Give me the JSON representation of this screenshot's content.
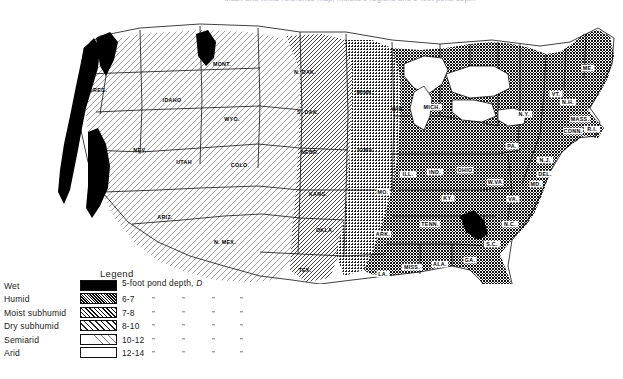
{
  "figure": {
    "caption_clipped": "black and white reference map, moisture regions and 5-foot pond depth"
  },
  "legend": {
    "title": "Legend",
    "header": "5-foot pond depth, D",
    "header_prefix": "5-foot pond depth,",
    "header_symbol": "D",
    "ditto_mark": "\"",
    "rows": [
      {
        "name": "Wet",
        "depth": "",
        "swatch": "solid-black",
        "color": "#000000"
      },
      {
        "name": "Humid",
        "depth": "6-7",
        "swatch": "dense-stipple",
        "color": "#1c1c1c"
      },
      {
        "name": "Moist subhumid",
        "depth": "7-8",
        "swatch": "medium-hatch",
        "color": "#6a6a6a"
      },
      {
        "name": "Dry subhumid",
        "depth": "8-10",
        "swatch": "light-hatch",
        "color": "#c9c9c9"
      },
      {
        "name": "Semiarid",
        "depth": "10-12",
        "swatch": "very-light",
        "color": "#efefef"
      },
      {
        "name": "Arid",
        "depth": "12-14",
        "swatch": "white",
        "color": "#ffffff"
      }
    ]
  },
  "map": {
    "region": "Contiguous United States",
    "states": [
      {
        "abbr": "WASH.",
        "x": 108,
        "y": 48,
        "tone": "dry"
      },
      {
        "abbr": "OREG.",
        "x": 98,
        "y": 88,
        "tone": "semi"
      },
      {
        "abbr": "IDAHO",
        "x": 172,
        "y": 98,
        "tone": "dry"
      },
      {
        "abbr": "MONT.",
        "x": 222,
        "y": 62,
        "tone": "semi"
      },
      {
        "abbr": "WYO.",
        "x": 232,
        "y": 117,
        "tone": "semi"
      },
      {
        "abbr": "NEV.",
        "x": 140,
        "y": 148,
        "tone": "arid"
      },
      {
        "abbr": "CAL.",
        "x": 100,
        "y": 180,
        "tone": "arid"
      },
      {
        "abbr": "UTAH",
        "x": 184,
        "y": 160,
        "tone": "arid"
      },
      {
        "abbr": "COLO.",
        "x": 240,
        "y": 163,
        "tone": "semi"
      },
      {
        "abbr": "ARIZ.",
        "x": 165,
        "y": 215,
        "tone": "arid"
      },
      {
        "abbr": "N. MEX.",
        "x": 225,
        "y": 240,
        "tone": "arid"
      },
      {
        "abbr": "N. DAK.",
        "x": 305,
        "y": 70,
        "tone": "semi"
      },
      {
        "abbr": "S. DAK.",
        "x": 308,
        "y": 110,
        "tone": "dry"
      },
      {
        "abbr": "NEBR.",
        "x": 310,
        "y": 150,
        "tone": "dry"
      },
      {
        "abbr": "KANS.",
        "x": 318,
        "y": 192,
        "tone": "dry"
      },
      {
        "abbr": "OKLA.",
        "x": 325,
        "y": 228,
        "tone": "dry"
      },
      {
        "abbr": "TEX.",
        "x": 305,
        "y": 268,
        "tone": "dry"
      },
      {
        "abbr": "MINN.",
        "x": 365,
        "y": 90,
        "tone": "moist"
      },
      {
        "abbr": "IOWA",
        "x": 365,
        "y": 148,
        "tone": "moist"
      },
      {
        "abbr": "MO.",
        "x": 383,
        "y": 190,
        "tone": "humid"
      },
      {
        "abbr": "ARK.",
        "x": 383,
        "y": 232,
        "tone": "humid"
      },
      {
        "abbr": "LA.",
        "x": 383,
        "y": 272,
        "tone": "humid"
      },
      {
        "abbr": "MISS.",
        "x": 412,
        "y": 265,
        "tone": "humid"
      },
      {
        "abbr": "ALA.",
        "x": 440,
        "y": 262,
        "tone": "humid"
      },
      {
        "abbr": "GA.",
        "x": 470,
        "y": 258,
        "tone": "humid"
      },
      {
        "abbr": "FLA.",
        "x": 503,
        "y": 320,
        "tone": "humid"
      },
      {
        "abbr": "TENN.",
        "x": 430,
        "y": 222,
        "tone": "humid"
      },
      {
        "abbr": "KY.",
        "x": 448,
        "y": 196,
        "tone": "humid"
      },
      {
        "abbr": "WIS.",
        "x": 398,
        "y": 107,
        "tone": "moist"
      },
      {
        "abbr": "MICH.",
        "x": 432,
        "y": 105,
        "tone": "humid"
      },
      {
        "abbr": "ILL.",
        "x": 408,
        "y": 172,
        "tone": "humid"
      },
      {
        "abbr": "IND.",
        "x": 435,
        "y": 170,
        "tone": "humid"
      },
      {
        "abbr": "OHIO",
        "x": 465,
        "y": 168,
        "tone": "humid"
      },
      {
        "abbr": "W.VA",
        "x": 495,
        "y": 180,
        "tone": "humid"
      },
      {
        "abbr": "VA.",
        "x": 513,
        "y": 197,
        "tone": "humid"
      },
      {
        "abbr": "N.C.",
        "x": 510,
        "y": 222,
        "tone": "humid"
      },
      {
        "abbr": "S.C.",
        "x": 492,
        "y": 242,
        "tone": "humid"
      },
      {
        "abbr": "PA.",
        "x": 512,
        "y": 144,
        "tone": "humid"
      },
      {
        "abbr": "N.Y.",
        "x": 524,
        "y": 112,
        "tone": "humid"
      },
      {
        "abbr": "ME.",
        "x": 588,
        "y": 66,
        "tone": "humid"
      },
      {
        "abbr": "VT.",
        "x": 556,
        "y": 92,
        "tone": "humid"
      },
      {
        "abbr": "N.H.",
        "x": 568,
        "y": 100,
        "tone": "humid"
      },
      {
        "abbr": "MASS.",
        "x": 580,
        "y": 117,
        "tone": "humid"
      },
      {
        "abbr": "CONN.",
        "x": 573,
        "y": 129,
        "tone": "humid"
      },
      {
        "abbr": "R.I.",
        "x": 592,
        "y": 127,
        "tone": "humid"
      },
      {
        "abbr": "N.J.",
        "x": 545,
        "y": 158,
        "tone": "humid"
      },
      {
        "abbr": "DEL.",
        "x": 545,
        "y": 172,
        "tone": "humid"
      },
      {
        "abbr": "MD.",
        "x": 536,
        "y": 182,
        "tone": "humid"
      }
    ]
  },
  "chart_data": {
    "type": "map",
    "legend_title": "Legend",
    "value_label": "5-foot pond depth, D",
    "categories": [
      "Wet",
      "Humid",
      "Moist subhumid",
      "Dry subhumid",
      "Semiarid",
      "Arid"
    ],
    "value_ranges": [
      "",
      "6-7",
      "7-8",
      "8-10",
      "10-12",
      "12-14"
    ],
    "shading": [
      "#000000",
      "#1c1c1c",
      "#6a6a6a",
      "#c9c9c9",
      "#efefef",
      "#ffffff"
    ],
    "legend_position": "bottom-left"
  }
}
